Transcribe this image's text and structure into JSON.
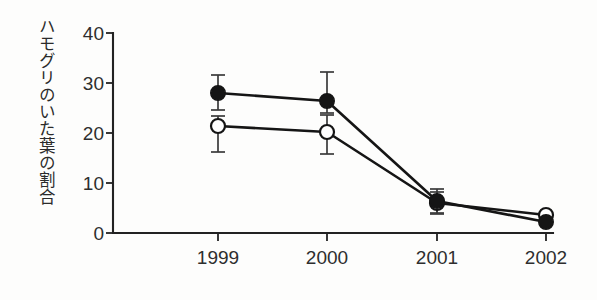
{
  "chart_data": {
    "type": "line",
    "title": "",
    "xlabel": "",
    "ylabel": "ハモグリのいた葉の割合",
    "categories": [
      "1999",
      "2000",
      "2001",
      "2002"
    ],
    "x_tick_labels": [
      "1999",
      "2000",
      "2001",
      "2002"
    ],
    "y_tick_labels": [
      "0",
      "10",
      "20",
      "30",
      "40"
    ],
    "y_ticks": [
      0,
      10,
      20,
      30,
      40
    ],
    "ylim": [
      0,
      40
    ],
    "grid": false,
    "legend": "none",
    "series": [
      {
        "name": "filled-circle-series",
        "marker": "filled-circle",
        "values": [
          28.0,
          26.4,
          6.4,
          2.2
        ],
        "err_low": [
          24.6,
          24.0,
          4.0,
          2.2
        ],
        "err_high": [
          31.6,
          32.2,
          8.8,
          2.2
        ]
      },
      {
        "name": "open-circle-series",
        "marker": "open-circle",
        "values": [
          21.4,
          20.2,
          6.0,
          3.6
        ],
        "err_low": [
          16.2,
          15.8,
          3.8,
          3.6
        ],
        "err_high": [
          23.4,
          23.6,
          8.2,
          3.6
        ]
      }
    ]
  },
  "axis_titles": {
    "y": "ハモグリのいた葉の割合"
  },
  "colors": {
    "line": "#151515",
    "axis": "#222222",
    "text": "#2e2e2e",
    "background": "#fdfdfc",
    "marker_fill": "#151515",
    "marker_open_fill": "#ffffff"
  }
}
